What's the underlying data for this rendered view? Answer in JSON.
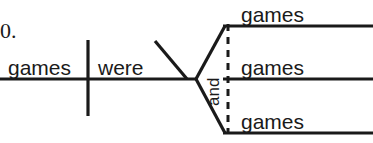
{
  "item_number": "0.",
  "diagram": {
    "type": "sentence-diagram",
    "subject": "games",
    "verb": "were",
    "conjunction": "and",
    "compound_complements": [
      "games",
      "games",
      "games"
    ],
    "stroke_color": "#1a1a1a",
    "text_color": "#1a1a1a",
    "background_color": "#ffffff"
  },
  "geometry": {
    "main_baseline_y": 79,
    "main_baseline_x1": 0,
    "main_baseline_x2": 196,
    "subject_verb_divider_x": 88,
    "subject_verb_divider_y1": 40,
    "subject_verb_divider_y2": 116,
    "modifier_slant_x1": 155,
    "modifier_slant_y1": 41,
    "modifier_slant_x2": 187,
    "modifier_slant_y2": 79,
    "fork_vertex_x": 196,
    "fork_vertex_y": 79,
    "branch_left_x": 224,
    "branch_right_x": 373,
    "branch_top_y": 26,
    "branch_mid_y": 79,
    "branch_bottom_y": 133,
    "dashed_line_x": 228,
    "dashed_line_y1": 26,
    "dashed_line_y2": 133
  }
}
